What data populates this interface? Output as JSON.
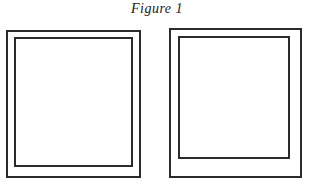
{
  "figure": {
    "caption": "Figure 1",
    "caption_style": "italic-serif",
    "background_color": "#ffffff",
    "line_color": "#2b2b2b"
  },
  "panels": [
    {
      "id": "left",
      "name": "left-panel",
      "outer": {
        "x": 6,
        "y": 30,
        "width": 135,
        "height": 148,
        "stroke": "#2b2b2b",
        "stroke_width": 2,
        "fill": "#ffffff"
      },
      "inner": {
        "x": 14,
        "y": 37,
        "width": 119,
        "height": 130,
        "stroke": "#2b2b2b",
        "stroke_width": 2,
        "fill": "#ffffff"
      }
    },
    {
      "id": "right",
      "name": "right-panel",
      "outer": {
        "x": 169,
        "y": 28,
        "width": 133,
        "height": 150,
        "stroke": "#2b2b2b",
        "stroke_width": 2,
        "fill": "#ffffff"
      },
      "inner": {
        "x": 178,
        "y": 36,
        "width": 112,
        "height": 123,
        "stroke": "#2b2b2b",
        "stroke_width": 2,
        "fill": "#ffffff"
      }
    }
  ]
}
